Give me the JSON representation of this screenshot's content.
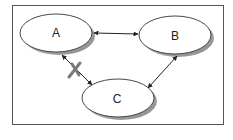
{
  "diagram": {
    "type": "relationship-graph",
    "frame": {
      "border_color": "#555555",
      "background": "#ffffff"
    },
    "nodes": [
      {
        "id": "A",
        "label": "A",
        "cx": 56,
        "cy": 33,
        "rx": 36,
        "ry": 19
      },
      {
        "id": "B",
        "label": "B",
        "cx": 175,
        "cy": 35,
        "rx": 36,
        "ry": 19
      },
      {
        "id": "C",
        "label": "C",
        "cx": 118,
        "cy": 98,
        "rx": 36,
        "ry": 19
      }
    ],
    "edges": [
      {
        "from": "A",
        "to": "B",
        "bidirectional": true,
        "blocked": false
      },
      {
        "from": "B",
        "to": "C",
        "bidirectional": true,
        "blocked": false
      },
      {
        "from": "A",
        "to": "C",
        "bidirectional": true,
        "blocked": true
      }
    ],
    "blocked_marker": {
      "symbol": "X",
      "color": "#7a7a7a"
    },
    "colors": {
      "node_fill": "#ffffff",
      "node_stroke": "#333333",
      "shadow": "#9a9a9a",
      "edge": "#222222"
    }
  }
}
